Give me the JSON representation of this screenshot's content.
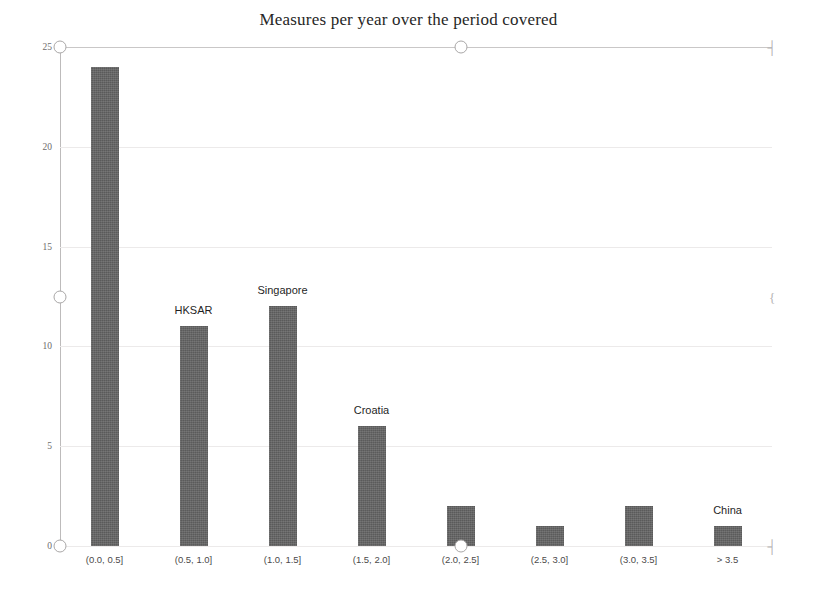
{
  "chart_data": {
    "type": "bar",
    "title": "Measures per year over the period covered",
    "xlabel": "",
    "ylabel": "",
    "categories": [
      "(0.0, 0.5]",
      "(0.5, 1.0]",
      "(1.0, 1.5]",
      "(1.5, 2.0]",
      "(2.0, 2.5]",
      "(2.5, 3.0]",
      "(3.0, 3.5]",
      "> 3.5"
    ],
    "values": [
      24,
      11,
      12,
      6,
      2,
      1,
      2,
      1
    ],
    "annotations": [
      {
        "category": "(0.5, 1.0]",
        "label": "HKSAR"
      },
      {
        "category": "(1.0, 1.5]",
        "label": "Singapore"
      },
      {
        "category": "(1.5, 2.0]",
        "label": "Croatia"
      },
      {
        "category": "> 3.5",
        "label": "China"
      }
    ],
    "ylim": [
      0,
      25
    ],
    "yticks": [
      0,
      5,
      10,
      15,
      20,
      25
    ],
    "ytick_labels": [
      "0",
      "5",
      "10",
      "15",
      "20",
      "25"
    ],
    "grid": true,
    "legend": false,
    "bar_color": "#636363",
    "axis_color": "#bdbbbb",
    "grid_color": "#eceaea",
    "title_color": "#262626"
  },
  "markers": {
    "handles": [
      {
        "name": "handle-top-left",
        "x_value": "(0.0, 0.5]",
        "y_value": 25
      },
      {
        "name": "handle-top-center",
        "x_value": "(2.0, 2.5]",
        "y_value": 25
      },
      {
        "name": "handle-mid-left",
        "x_value": "(0.0, 0.5]",
        "y_value": 12.5
      },
      {
        "name": "handle-bottom-left",
        "x_value": "(0.0, 0.5]",
        "y_value": 0
      },
      {
        "name": "handle-bottom-center",
        "x_value": "(2.0, 2.5]",
        "y_value": 0
      }
    ],
    "edge_ticks": [
      {
        "name": "edge-tick-top",
        "glyph": "┤"
      },
      {
        "name": "edge-tick-middle",
        "glyph": "{"
      },
      {
        "name": "edge-tick-bottom",
        "glyph": "┤"
      }
    ]
  }
}
